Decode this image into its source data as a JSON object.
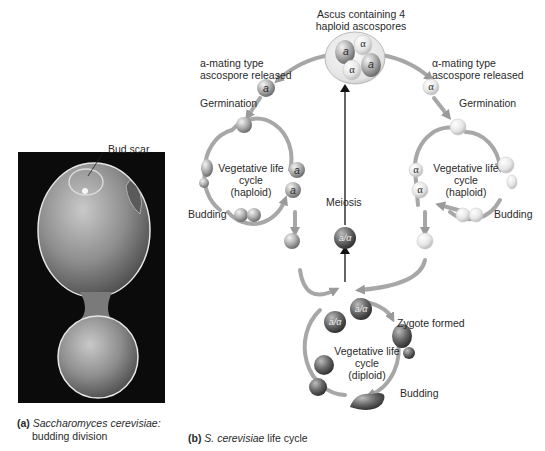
{
  "panel_a": {
    "photo_label": "Bud scar",
    "caption_letter": "(a)",
    "caption_italic": "Saccharomyces cerevisiae:",
    "caption_line2": "budding division"
  },
  "panel_b": {
    "caption_letter": "(b)",
    "caption_italic": "S. cerevisiae",
    "caption_rest": " life cycle",
    "ascus_label_line1": "Ascus containing 4",
    "ascus_label_line2": "haploid ascospores",
    "a_released_line1": "a-mating type",
    "a_released_line2": "ascospore released",
    "alpha_released_line1": "α-mating type",
    "alpha_released_line2": "ascospore released",
    "germination_left": "Germination",
    "germination_right": "Germination",
    "veg_haploid_left": [
      "Vegetative life",
      "cycle",
      "(haploid)"
    ],
    "veg_haploid_right": [
      "Vegetative life",
      "cycle",
      "(haploid)"
    ],
    "budding_left": "Budding",
    "budding_right": "Budding",
    "meiosis": "Meiosis",
    "zygote_formed": "Zygote formed",
    "veg_diploid": [
      "Vegetative life",
      "cycle",
      "(diploid)"
    ],
    "budding_bottom": "Budding",
    "cell_labels": {
      "a": "a",
      "alpha": "α",
      "diploid": "a/α"
    }
  }
}
